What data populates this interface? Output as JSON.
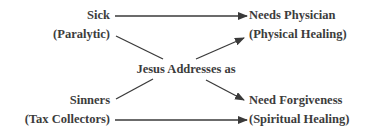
{
  "diagram": {
    "left_top": {
      "line1": "Sick",
      "line2": "(Paralytic)"
    },
    "left_bottom": {
      "line1": "Sinners",
      "line2": "(Tax Collectors)"
    },
    "center": {
      "label": "Jesus Addresses as"
    },
    "right_top": {
      "line1": "Needs Physician",
      "line2": "(Physical Healing)"
    },
    "right_bottom": {
      "line1": "Need Forgiveness",
      "line2": "(Spiritual Healing)"
    }
  },
  "colors": {
    "text": "#3c3c3c",
    "line": "#3a3a3a",
    "background": "#ffffff"
  }
}
